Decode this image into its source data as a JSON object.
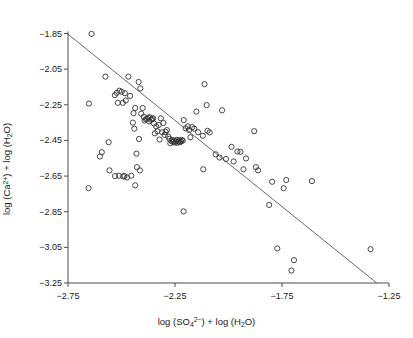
{
  "chart_data": {
    "type": "scatter",
    "title": "",
    "xlabel": "log (SO4 2-) + log (H2O)",
    "ylabel": "log (Ca 2+) + log (H2O)",
    "xlabel_parts": {
      "pre": "log (SO",
      "sub": "4",
      "sup": "2−",
      "mid": ") + log (H",
      "sub2": "2",
      "post": "O)"
    },
    "ylabel_parts": {
      "pre": "log (Ca",
      "sup": "2+",
      "mid": ") + log (H",
      "sub2": "2",
      "post": "O)"
    },
    "xlim": [
      -2.75,
      -1.25
    ],
    "ylim": [
      -3.25,
      -1.85
    ],
    "xticks": [
      -2.75,
      -2.25,
      -1.75,
      -1.25
    ],
    "yticks": [
      -1.85,
      -2.05,
      -2.25,
      -2.45,
      -2.65,
      -2.85,
      -3.05,
      -3.25
    ],
    "xtick_labels": [
      "−2.75",
      "−2.25",
      "−1.75",
      "−1.25"
    ],
    "ytick_labels": [
      "−1.85",
      "−2.05",
      "−2.25",
      "−2.45",
      "−2.65",
      "−2.85",
      "−3.05",
      "−3.25"
    ],
    "grid": false,
    "legend": null,
    "marker": {
      "shape": "open-circle",
      "radius": 2.6,
      "stroke": "#333333",
      "fill": "none",
      "stroke_width": 0.9
    },
    "trendline": {
      "type": "line",
      "stroke": "#6b6b6b",
      "stroke_width": 1.0,
      "x0": -2.752,
      "y0": -1.852,
      "x1": -1.305,
      "y1": -3.252
    },
    "axis_color": "#4d4d4d",
    "background": "#ffffff",
    "points": [
      [
        -2.64,
        -1.852
      ],
      [
        -2.652,
        -2.243
      ],
      [
        -2.575,
        -2.092
      ],
      [
        -2.51,
        -2.171
      ],
      [
        -2.522,
        -2.183
      ],
      [
        -2.531,
        -2.196
      ],
      [
        -2.517,
        -2.239
      ],
      [
        -2.499,
        -2.177
      ],
      [
        -2.494,
        -2.239
      ],
      [
        -2.484,
        -2.185
      ],
      [
        -2.48,
        -2.226
      ],
      [
        -2.468,
        -2.092
      ],
      [
        -2.46,
        -2.2
      ],
      [
        -2.447,
        -2.35
      ],
      [
        -2.444,
        -2.297
      ],
      [
        -2.44,
        -2.384
      ],
      [
        -2.436,
        -2.268
      ],
      [
        -2.42,
        -2.122
      ],
      [
        -2.412,
        -2.158
      ],
      [
        -2.408,
        -2.3
      ],
      [
        -2.401,
        -2.268
      ],
      [
        -2.396,
        -2.318
      ],
      [
        -2.392,
        -2.338
      ],
      [
        -2.386,
        -2.331
      ],
      [
        -2.381,
        -2.328
      ],
      [
        -2.375,
        -2.322
      ],
      [
        -2.371,
        -2.343
      ],
      [
        -2.367,
        -2.32
      ],
      [
        -2.362,
        -2.334
      ],
      [
        -2.357,
        -2.33
      ],
      [
        -2.352,
        -2.326
      ],
      [
        -2.348,
        -2.355
      ],
      [
        -2.344,
        -2.41
      ],
      [
        -2.338,
        -2.371
      ],
      [
        -2.332,
        -2.399
      ],
      [
        -2.326,
        -2.363
      ],
      [
        -2.322,
        -2.445
      ],
      [
        -2.316,
        -2.326
      ],
      [
        -2.31,
        -2.404
      ],
      [
        -2.304,
        -2.352
      ],
      [
        -2.298,
        -2.419
      ],
      [
        -2.294,
        -2.402
      ],
      [
        -2.288,
        -2.392
      ],
      [
        -2.282,
        -2.428
      ],
      [
        -2.276,
        -2.441
      ],
      [
        -2.272,
        -2.466
      ],
      [
        -2.266,
        -2.455
      ],
      [
        -2.262,
        -2.448
      ],
      [
        -2.258,
        -2.459
      ],
      [
        -2.254,
        -2.451
      ],
      [
        -2.25,
        -2.462
      ],
      [
        -2.246,
        -2.455
      ],
      [
        -2.242,
        -2.447
      ],
      [
        -2.238,
        -2.463
      ],
      [
        -2.234,
        -2.456
      ],
      [
        -2.23,
        -2.449
      ],
      [
        -2.226,
        -2.46
      ],
      [
        -2.222,
        -2.455
      ],
      [
        -2.218,
        -2.447
      ],
      [
        -2.214,
        -2.452
      ],
      [
        -2.209,
        -2.336
      ],
      [
        -2.2,
        -2.382
      ],
      [
        -2.19,
        -2.371
      ],
      [
        -2.184,
        -2.392
      ],
      [
        -2.178,
        -2.432
      ],
      [
        -2.17,
        -2.376
      ],
      [
        -2.16,
        -2.384
      ],
      [
        -2.15,
        -2.288
      ],
      [
        -2.142,
        -2.404
      ],
      [
        -2.12,
        -2.424
      ],
      [
        -2.112,
        -2.134
      ],
      [
        -2.102,
        -2.252
      ],
      [
        -2.098,
        -2.396
      ],
      [
        -2.088,
        -2.405
      ],
      [
        -2.06,
        -2.528
      ],
      [
        -2.042,
        -2.546
      ],
      [
        -2.03,
        -2.281
      ],
      [
        -2.012,
        -2.554
      ],
      [
        -1.986,
        -2.486
      ],
      [
        -1.976,
        -2.568
      ],
      [
        -1.958,
        -2.512
      ],
      [
        -1.944,
        -2.514
      ],
      [
        -1.93,
        -2.612
      ],
      [
        -1.918,
        -2.551
      ],
      [
        -1.88,
        -2.398
      ],
      [
        -1.872,
        -2.6
      ],
      [
        -1.862,
        -2.618
      ],
      [
        -1.81,
        -2.812
      ],
      [
        -1.796,
        -2.682
      ],
      [
        -1.772,
        -3.056
      ],
      [
        -1.742,
        -2.718
      ],
      [
        -1.73,
        -2.672
      ],
      [
        -1.706,
        -3.18
      ],
      [
        -1.694,
        -3.122
      ],
      [
        -1.61,
        -2.678
      ],
      [
        -1.336,
        -3.06
      ],
      [
        -2.56,
        -2.46
      ],
      [
        -2.592,
        -2.516
      ],
      [
        -2.601,
        -2.54
      ],
      [
        -2.556,
        -2.618
      ],
      [
        -2.53,
        -2.65
      ],
      [
        -2.512,
        -2.648
      ],
      [
        -2.492,
        -2.652
      ],
      [
        -2.474,
        -2.658
      ],
      [
        -2.436,
        -2.702
      ],
      [
        -2.43,
        -2.524
      ],
      [
        -2.428,
        -2.6
      ],
      [
        -2.418,
        -2.442
      ],
      [
        -2.414,
        -2.618
      ],
      [
        -2.654,
        -2.718
      ],
      [
        -2.486,
        -2.65
      ],
      [
        -2.454,
        -2.648
      ],
      [
        -2.21,
        -2.848
      ],
      [
        -2.118,
        -2.612
      ]
    ]
  },
  "figure": {
    "axis_line_color": "#4d4d4d",
    "marker_color": "#333333",
    "line_color": "#6b6b6b"
  }
}
